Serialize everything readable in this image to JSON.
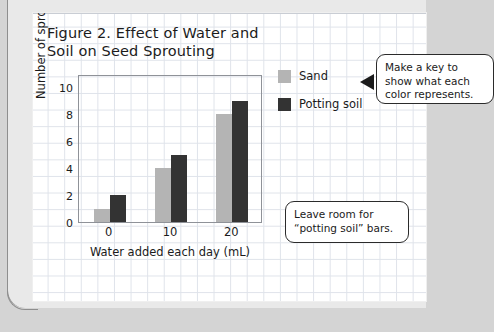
{
  "figure": {
    "title": "Figure 2. Effect of Water and\nSoil on Seed Sprouting"
  },
  "legend": {
    "items": [
      {
        "label": "Sand",
        "color": "#b4b4b4"
      },
      {
        "label": "Potting soil",
        "color": "#333333"
      }
    ]
  },
  "annotations": [
    {
      "name": "callout-make-key",
      "text": "Make a key to\nshow what each\ncolor represents."
    },
    {
      "name": "callout-leave-room",
      "text": "Leave room for\n“potting soil” bars."
    }
  ],
  "chart_data": {
    "type": "bar",
    "title": "Figure 2. Effect of Water and Soil on Seed Sprouting",
    "xlabel": "Water added each day (mL)",
    "ylabel": "Number of sprouting seeds",
    "categories": [
      "0",
      "10",
      "20"
    ],
    "series": [
      {
        "name": "Sand",
        "color": "#b4b4b4",
        "values": [
          1,
          4,
          8
        ]
      },
      {
        "name": "Potting soil",
        "color": "#333333",
        "values": [
          2,
          5,
          9
        ]
      }
    ],
    "ylim": [
      0,
      11
    ],
    "yticks": [
      0,
      2,
      4,
      6,
      8,
      10
    ],
    "ytick_labels": [
      "0",
      "2",
      "4",
      "6",
      "8",
      "10"
    ],
    "xtick_labels": [
      "0",
      "10",
      "20"
    ],
    "grid": false,
    "legend_position": "right"
  }
}
